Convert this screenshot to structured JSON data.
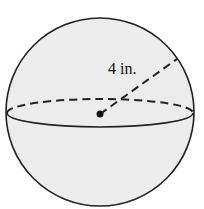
{
  "figure": {
    "shape": "sphere",
    "radius_label": "4 in.",
    "colors": {
      "fill": "#ececec",
      "stroke": "#222222",
      "background": "#ffffff"
    }
  }
}
